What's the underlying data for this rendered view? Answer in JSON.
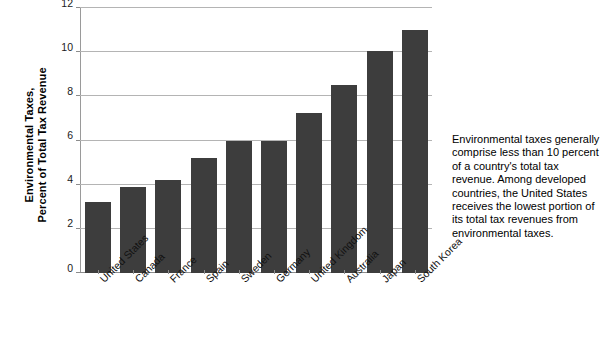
{
  "chart_data": {
    "type": "bar",
    "title": "",
    "xlabel": "",
    "ylabel": "Environmental Taxes, Percent of Total Tax Revenue",
    "ylabel_lines": [
      "Environmental Taxes,",
      "Percent of Total Tax Revenue"
    ],
    "categories": [
      "United States",
      "Canada",
      "France",
      "Spain",
      "Sweden",
      "Germany",
      "United Kingdom",
      "Australia",
      "Japan",
      "South Korea"
    ],
    "values": [
      3.2,
      3.9,
      4.2,
      5.2,
      6.0,
      6.0,
      7.25,
      8.5,
      10.05,
      11.0
    ],
    "ylim": [
      0,
      12
    ],
    "yticks": [
      0,
      2,
      4,
      6,
      8,
      10,
      12
    ],
    "ytick_labels": [
      "0",
      "2",
      "4",
      "6",
      "8",
      "10",
      "12"
    ],
    "grid": true,
    "grid_axis": "y",
    "legend": false,
    "bar_color": "#3d3d3d",
    "gridline_color": "#b4b4b4",
    "axis_color": "#8c8c8c"
  },
  "side_note": {
    "text": "Environmental taxes generally comprise less than 10 percent of a country's total tax revenue. Among developed countries, the United States receives the lowest portion of its total tax revenues from environmental taxes."
  },
  "source_line": {
    "text": ""
  }
}
